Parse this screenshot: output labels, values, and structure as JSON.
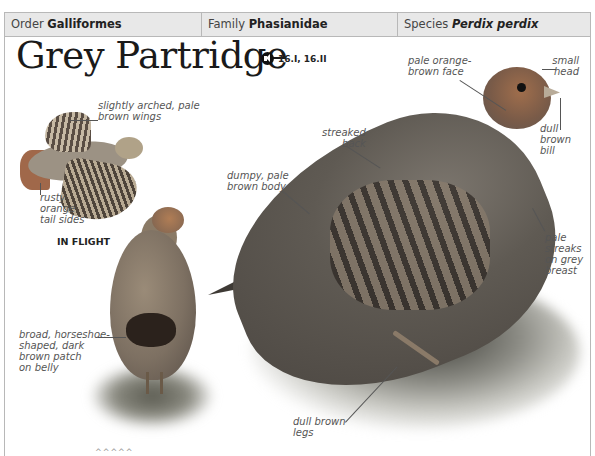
{
  "header": {
    "order": {
      "label": "Order",
      "value": "Galliformes"
    },
    "family": {
      "label": "Family",
      "value": "Phasianidae"
    },
    "species": {
      "label": "Species",
      "value": "Perdix perdix"
    }
  },
  "title": "Grey Partridge",
  "sound": {
    "icon": "speaker-icon",
    "tracks": "16.I, 16.II"
  },
  "flight_caption": "IN FLIGHT",
  "annotations": {
    "wings": [
      "slightly arched, pale",
      "brown wings"
    ],
    "tail": [
      "rusty",
      "orange",
      "tail sides"
    ],
    "belly": [
      "broad, horseshoe-",
      "shaped, dark",
      "brown patch",
      "on belly"
    ],
    "back": [
      "streaked",
      "back"
    ],
    "body": [
      "dumpy, pale",
      "brown body"
    ],
    "face": [
      "pale orange-",
      "brown face"
    ],
    "head": [
      "small",
      "head"
    ],
    "bill": [
      "dull",
      "brown",
      "bill"
    ],
    "breast": [
      "pale",
      "streaks",
      "on grey",
      "breast"
    ],
    "legs": [
      "dull brown",
      "legs"
    ]
  },
  "footer_marks": "^^^^^"
}
